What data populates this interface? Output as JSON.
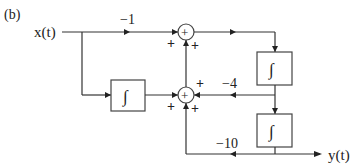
{
  "figure": {
    "panel_label": "(b)",
    "input_label": "x(t)",
    "input_label_var": "t",
    "output_label": "y(t)"
  },
  "blocks": {
    "integrator_left": {
      "symbol": "∫"
    },
    "integrator_top_right": {
      "symbol": "∫"
    },
    "integrator_bottom_right": {
      "symbol": "∫"
    }
  },
  "summers": {
    "top": {
      "symbol": "+",
      "signs": [
        "+",
        "+"
      ]
    },
    "bottom": {
      "symbol": "+",
      "signs": [
        "+",
        "+",
        "+"
      ]
    }
  },
  "gains": {
    "feedforward": "−1",
    "feedback_mid": "−4",
    "feedback_low": "−10"
  }
}
